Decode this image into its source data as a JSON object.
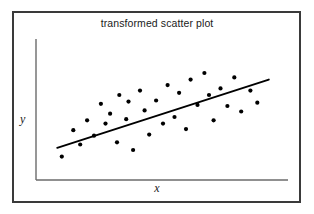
{
  "figure": {
    "title": "transformed scatter plot",
    "background_color": "#ffffff",
    "frame_color": "#3a3a3a",
    "ink_color": "#000000",
    "axis_color": "#6b6b6b"
  },
  "axes": {
    "x_label": "x",
    "y_label": "y"
  },
  "chart_data": {
    "type": "scatter",
    "title": "transformed scatter plot",
    "xlabel": "x",
    "ylabel": "y",
    "grid": false,
    "legend": null,
    "tick_labels": {
      "x": [],
      "y": []
    },
    "xlim": [
      0,
      100
    ],
    "ylim": [
      0,
      100
    ],
    "points": [
      [
        6,
        14
      ],
      [
        11,
        38
      ],
      [
        14,
        25
      ],
      [
        17,
        47
      ],
      [
        20,
        33
      ],
      [
        23,
        62
      ],
      [
        25,
        44
      ],
      [
        27,
        53
      ],
      [
        30,
        27
      ],
      [
        31,
        70
      ],
      [
        34,
        48
      ],
      [
        35,
        64
      ],
      [
        37,
        20
      ],
      [
        40,
        74
      ],
      [
        42,
        56
      ],
      [
        44,
        34
      ],
      [
        47,
        65
      ],
      [
        50,
        44
      ],
      [
        52,
        79
      ],
      [
        55,
        50
      ],
      [
        57,
        72
      ],
      [
        60,
        39
      ],
      [
        62,
        84
      ],
      [
        65,
        61
      ],
      [
        68,
        90
      ],
      [
        70,
        70
      ],
      [
        72,
        47
      ],
      [
        75,
        76
      ],
      [
        78,
        60
      ],
      [
        81,
        86
      ],
      [
        84,
        55
      ],
      [
        88,
        74
      ],
      [
        91,
        63
      ]
    ],
    "trend_line": {
      "type": "linear",
      "x_start": 4,
      "y_start": 22,
      "x_end": 96,
      "y_end": 84
    }
  }
}
